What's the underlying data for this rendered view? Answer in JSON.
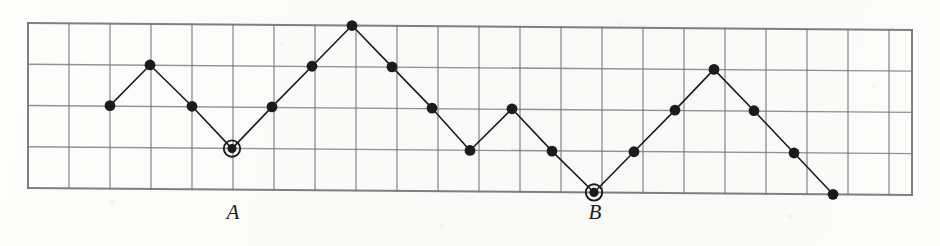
{
  "figure": {
    "title": "",
    "background_color": "#fbfbfa",
    "ink_color": "#1b1b1b",
    "grid_color": "#75757a"
  },
  "grid": {
    "x0": 28,
    "y0": 23,
    "x1": 912,
    "y1": 188,
    "cell_width": 41,
    "cell_height": 41.25,
    "columns": 21.5,
    "rows": 4,
    "skew_degrees": 0.45
  },
  "labels": [
    {
      "name": "label-a",
      "text": "A",
      "x": 233,
      "y": 200
    },
    {
      "name": "label-b",
      "text": "B",
      "x": 595,
      "y": 200
    }
  ],
  "chart_data": {
    "type": "line",
    "title": "",
    "xlabel": "",
    "ylabel": "",
    "grid": true,
    "legend": null,
    "xlim": [
      0,
      21.5
    ],
    "ylim": [
      0,
      4
    ],
    "note": "Zigzag polyline on a square grid; vertices alternate up/down by one grid unit. Point A is a local minimum at (5,1); point B is a global minimum at (13.8,0). Values given as grid coordinates with origin at the lower-left corner of the grid, y measured upward in grid cells.",
    "series": [
      {
        "name": "zigzag-path",
        "marker": "filled-circle",
        "points": [
          {
            "x": 2.0,
            "y": 2.0,
            "px": 110,
            "py": 105,
            "marked": false
          },
          {
            "x": 3.0,
            "y": 3.0,
            "px": 150,
            "py": 64,
            "marked": false
          },
          {
            "x": 4.0,
            "y": 2.0,
            "px": 192,
            "py": 105,
            "marked": false
          },
          {
            "x": 5.0,
            "y": 1.0,
            "px": 232,
            "py": 147,
            "marked": true,
            "label": "A"
          },
          {
            "x": 6.0,
            "y": 2.0,
            "px": 272,
            "py": 105,
            "marked": false
          },
          {
            "x": 7.0,
            "y": 3.0,
            "px": 312,
            "py": 64,
            "marked": false
          },
          {
            "x": 7.9,
            "y": 4.0,
            "px": 352,
            "py": 23,
            "marked": false
          },
          {
            "x": 8.9,
            "y": 3.0,
            "px": 392,
            "py": 64,
            "marked": false
          },
          {
            "x": 9.9,
            "y": 2.0,
            "px": 432,
            "py": 105,
            "marked": false
          },
          {
            "x": 10.8,
            "y": 1.0,
            "px": 470,
            "py": 147,
            "marked": false
          },
          {
            "x": 11.8,
            "y": 2.0,
            "px": 512,
            "py": 105,
            "marked": false
          },
          {
            "x": 12.8,
            "y": 1.0,
            "px": 552,
            "py": 147,
            "marked": false
          },
          {
            "x": 13.8,
            "y": 0.0,
            "px": 594,
            "py": 188,
            "marked": true,
            "label": "B"
          },
          {
            "x": 14.8,
            "y": 1.0,
            "px": 634,
            "py": 147,
            "marked": false
          },
          {
            "x": 15.8,
            "y": 2.0,
            "px": 675,
            "py": 105,
            "marked": false
          },
          {
            "x": 16.7,
            "y": 3.0,
            "px": 714,
            "py": 64,
            "marked": false
          },
          {
            "x": 17.7,
            "y": 2.0,
            "px": 754,
            "py": 105,
            "marked": false
          },
          {
            "x": 18.7,
            "y": 1.0,
            "px": 794,
            "py": 147,
            "marked": false
          },
          {
            "x": 19.6,
            "y": 0.0,
            "px": 833,
            "py": 188,
            "marked": false
          }
        ]
      }
    ],
    "annotations": [
      {
        "text": "A",
        "at_point_index": 3,
        "position": "below-axis"
      },
      {
        "text": "B",
        "at_point_index": 12,
        "position": "below-axis"
      }
    ]
  }
}
